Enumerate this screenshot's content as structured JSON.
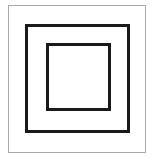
{
  "symbol": {
    "name": "double-square",
    "colors": {
      "background": "#ffffff",
      "outer_frame": "#a8a8a8",
      "squares": "#1a1a1a"
    },
    "shapes": [
      {
        "id": "outer-frame",
        "type": "rectangle",
        "stroke": "thin-gray"
      },
      {
        "id": "middle-square",
        "type": "square",
        "stroke": "thick-black"
      },
      {
        "id": "inner-square",
        "type": "square",
        "stroke": "thick-black"
      }
    ]
  }
}
